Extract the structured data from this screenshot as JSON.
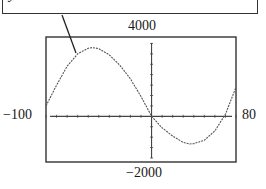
{
  "equation": {
    "label": "y = .088x³ + 0.8x² − 92x + 150"
  },
  "window": {
    "xmin_label": "−100",
    "xmax_label": "80",
    "ymin_label": "−2000",
    "ymax_label": "4000"
  },
  "chart_data": {
    "type": "line",
    "title": "y = .088x³ + 0.8x² − 92x + 150",
    "xlabel": "",
    "ylabel": "",
    "xlim": [
      -100,
      80
    ],
    "ylim": [
      -2000,
      4000
    ],
    "x_tick_spacing": 10,
    "y_tick_spacing": 500,
    "grid": false,
    "legend": "none",
    "annotations": [
      "pointer line from equation label to curve near its local maximum"
    ],
    "series": [
      {
        "name": "cubic",
        "x": [
          -100,
          -90,
          -80,
          -70,
          -60,
          -56,
          -50,
          -40,
          -30,
          -20,
          -10,
          0,
          10,
          20,
          30,
          36,
          40,
          50,
          60,
          70,
          80
        ],
        "values": [
          500,
          1500,
          2400,
          3000,
          3270,
          3300,
          3250,
          2950,
          2450,
          1800,
          950,
          0,
          -550,
          -950,
          -1250,
          -1330,
          -1310,
          -1150,
          -700,
          100,
          1400
        ]
      }
    ]
  },
  "colors": {
    "frame": "#333333",
    "curve": "#444444",
    "background": "#ffffff"
  }
}
